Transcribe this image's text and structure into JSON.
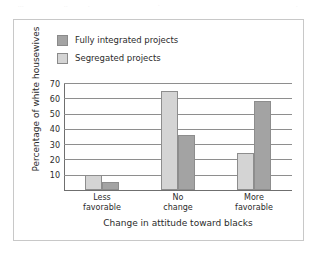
{
  "chart_data": {
    "type": "bar",
    "title": "",
    "xlabel": "Change in attitude toward blacks",
    "ylabel": "Percentage of white housewives",
    "categories": [
      "Less favorable",
      "No change",
      "More favorable"
    ],
    "category_lines": [
      [
        "Less",
        "favorable"
      ],
      [
        "No",
        "change"
      ],
      [
        "More",
        "favorable"
      ]
    ],
    "series": [
      {
        "name": "Segregated projects",
        "values": [
          10,
          65,
          24
        ],
        "color": "#d4d4d4"
      },
      {
        "name": "Fully integrated projects",
        "values": [
          5,
          36,
          58
        ],
        "color": "#a3a3a3"
      }
    ],
    "ylim": [
      0,
      70
    ],
    "yticks": [
      10,
      20,
      30,
      40,
      50,
      60,
      70
    ],
    "ytick_labels": [
      "10",
      "20",
      "30",
      "40",
      "50",
      "60",
      "70"
    ],
    "grid": true,
    "legend_position": "top-left",
    "legend_order": [
      "Fully integrated projects",
      "Segregated projects"
    ]
  },
  "legend": {
    "items": [
      {
        "label": "Fully integrated projects",
        "swatch": "dark-gray-swatch"
      },
      {
        "label": "Segregated projects",
        "swatch": "light-gray-swatch"
      }
    ]
  },
  "artifact": {
    "fragments": [
      "...",
      "..",
      ".",
      "·",
      "."
    ]
  }
}
